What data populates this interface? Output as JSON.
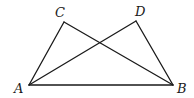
{
  "figure": {
    "type": "geometry",
    "stroke_color": "#1a1a1a",
    "background": "#ffffff"
  },
  "points": {
    "A": {
      "label": "A",
      "x": 29,
      "y": 85,
      "label_x": 14,
      "label_y": 93
    },
    "B": {
      "label": "B",
      "x": 173,
      "y": 85,
      "label_x": 177,
      "label_y": 93
    },
    "C": {
      "label": "C",
      "x": 64,
      "y": 22,
      "label_x": 55,
      "label_y": 17
    },
    "D": {
      "label": "D",
      "x": 136,
      "y": 21,
      "label_x": 135,
      "label_y": 16
    }
  },
  "segments": [
    {
      "name": "AB",
      "from": "A",
      "to": "B"
    },
    {
      "name": "AC",
      "from": "A",
      "to": "C"
    },
    {
      "name": "CB",
      "from": "C",
      "to": "B"
    },
    {
      "name": "AD",
      "from": "A",
      "to": "D"
    },
    {
      "name": "DB",
      "from": "D",
      "to": "B"
    }
  ]
}
